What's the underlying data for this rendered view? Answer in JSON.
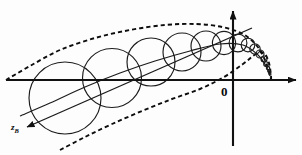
{
  "figure": {
    "kind": "geometric-diagram",
    "background_color": "#fdfdfd",
    "ink_color": "#111111"
  },
  "labels": {
    "origin": "0",
    "z_axis_letter": "z",
    "z_axis_subscript": "B"
  },
  "axes": {
    "horizontal": {
      "name": "horizontal-axis",
      "y": 80,
      "x_start": 6,
      "x_end": 296,
      "arrow_at_end": true,
      "arrow_at_start": false
    },
    "vertical": {
      "name": "vertical-axis",
      "x": 233,
      "y_start": 146,
      "y_end": 11,
      "arrow_at_end": true,
      "arrow_at_start": false
    },
    "diagonal": {
      "name": "z-axis",
      "x_start": 252,
      "y_start": 28,
      "x_end": 27,
      "y_end": 127,
      "arrow_at_end": true,
      "arrow_at_start": false
    }
  },
  "chart_data": {
    "type": "scatter",
    "title": "",
    "xlabel": "",
    "ylabel": "",
    "grid": false,
    "legend": null,
    "xlim": [
      0,
      302
    ],
    "ylim": [
      0,
      155
    ],
    "circles": [
      {
        "cx": 65,
        "cy": 98,
        "r": 36.0
      },
      {
        "cx": 112,
        "cy": 78,
        "r": 29.5
      },
      {
        "cx": 151,
        "cy": 62,
        "r": 24.0
      },
      {
        "cx": 182,
        "cy": 52,
        "r": 19.0
      },
      {
        "cx": 206,
        "cy": 46,
        "r": 15.0
      },
      {
        "cx": 224,
        "cy": 43,
        "r": 11.6
      },
      {
        "cx": 238,
        "cy": 43,
        "r": 8.9
      },
      {
        "cx": 248,
        "cy": 45,
        "r": 6.8
      },
      {
        "cx": 255,
        "cy": 49,
        "r": 5.2
      },
      {
        "cx": 260,
        "cy": 54,
        "r": 4.0
      },
      {
        "cx": 264,
        "cy": 59,
        "r": 3.0
      },
      {
        "cx": 266,
        "cy": 64,
        "r": 2.3
      },
      {
        "cx": 268,
        "cy": 68,
        "r": 1.7
      },
      {
        "cx": 269,
        "cy": 71,
        "r": 1.3
      },
      {
        "cx": 270,
        "cy": 74,
        "r": 1.0
      }
    ],
    "upper_envelope": [
      [
        6,
        80
      ],
      [
        30,
        66
      ],
      [
        60,
        50
      ],
      [
        95,
        38
      ],
      [
        130,
        30
      ],
      [
        165,
        25
      ],
      [
        196,
        24
      ],
      [
        222,
        27
      ],
      [
        243,
        34
      ],
      [
        257,
        46
      ],
      [
        265,
        60
      ],
      [
        269,
        72
      ],
      [
        271,
        79
      ]
    ],
    "lower_envelope": [
      [
        60,
        150
      ],
      [
        85,
        137
      ],
      [
        112,
        124
      ],
      [
        142,
        111
      ],
      [
        172,
        99
      ],
      [
        200,
        89
      ],
      [
        224,
        77
      ],
      [
        243,
        64
      ],
      [
        256,
        54
      ],
      [
        264,
        53
      ],
      [
        269,
        63
      ],
      [
        271,
        76
      ],
      [
        271,
        80
      ]
    ],
    "center_curve": [
      [
        20,
        116
      ],
      [
        50,
        103
      ],
      [
        85,
        87
      ],
      [
        120,
        73
      ],
      [
        155,
        61
      ],
      [
        190,
        51
      ],
      [
        220,
        44
      ],
      [
        243,
        45
      ],
      [
        258,
        55
      ],
      [
        266,
        66
      ],
      [
        270,
        76
      ]
    ]
  }
}
